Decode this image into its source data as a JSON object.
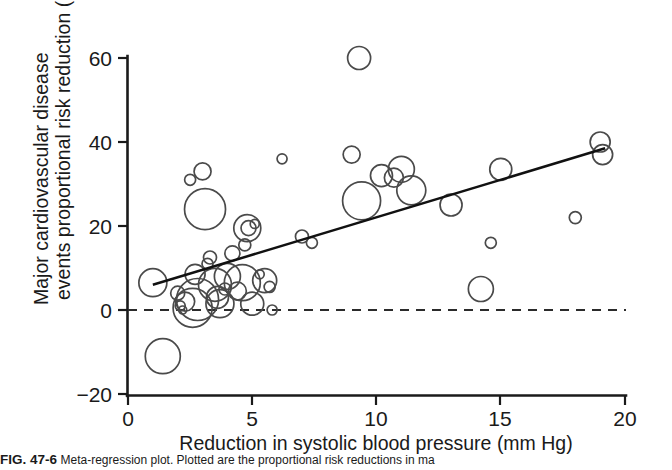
{
  "figure": {
    "caption_label": "FIG. 47-6",
    "caption_body": "Meta-regression plot. Plotted are the proportional risk reductions in ma"
  },
  "chart_data": {
    "type": "scatter",
    "title": "",
    "subtitle": "",
    "xlabel": "Reduction in systolic blood pressure (mm Hg)",
    "ylabel": "Major cardiovascular disease events proportional risk reduction (%)",
    "xlim": [
      0,
      20
    ],
    "ylim": [
      -20,
      60
    ],
    "xticks": [
      0,
      5,
      10,
      15,
      20
    ],
    "xtick_labels": [
      "0",
      "5",
      "10",
      "15",
      "20"
    ],
    "yticks": [
      -20,
      0,
      20,
      40,
      60
    ],
    "ytick_labels": [
      "−20",
      "0",
      "20",
      "40",
      "60"
    ],
    "grid": false,
    "legend": "none",
    "marker_style": "open-circle-bubble",
    "bubble_size_meaning": "trial weight / sample size",
    "series": [
      {
        "name": "Trials",
        "points": [
          {
            "x": 1.0,
            "y": 6.5,
            "r": 14.0
          },
          {
            "x": 1.4,
            "y": -11.0,
            "r": 17.5
          },
          {
            "x": 2.0,
            "y": 4.0,
            "r": 7.0
          },
          {
            "x": 2.1,
            "y": 1.0,
            "r": 5.0
          },
          {
            "x": 2.2,
            "y": 0.0,
            "r": 4.0
          },
          {
            "x": 2.3,
            "y": 2.0,
            "r": 9.5
          },
          {
            "x": 2.5,
            "y": 31.0,
            "r": 5.5
          },
          {
            "x": 2.6,
            "y": 0.5,
            "r": 19.5
          },
          {
            "x": 2.7,
            "y": 8.5,
            "r": 10.0
          },
          {
            "x": 2.8,
            "y": 2.5,
            "r": 21.0
          },
          {
            "x": 3.0,
            "y": 33.0,
            "r": 8.5
          },
          {
            "x": 3.1,
            "y": 24.0,
            "r": 20.5
          },
          {
            "x": 3.2,
            "y": 11.0,
            "r": 5.5
          },
          {
            "x": 3.3,
            "y": 12.5,
            "r": 6.5
          },
          {
            "x": 3.5,
            "y": 6.0,
            "r": 16.5
          },
          {
            "x": 3.6,
            "y": 3.0,
            "r": 11.0
          },
          {
            "x": 3.7,
            "y": 1.5,
            "r": 14.0
          },
          {
            "x": 3.9,
            "y": 5.0,
            "r": 6.0
          },
          {
            "x": 4.0,
            "y": 8.0,
            "r": 13.0
          },
          {
            "x": 4.2,
            "y": 13.5,
            "r": 7.5
          },
          {
            "x": 4.4,
            "y": 4.5,
            "r": 9.0
          },
          {
            "x": 4.6,
            "y": 6.5,
            "r": 18.0
          },
          {
            "x": 4.7,
            "y": 15.5,
            "r": 6.0
          },
          {
            "x": 4.8,
            "y": 19.5,
            "r": 13.5
          },
          {
            "x": 4.85,
            "y": 19.5,
            "r": 7.5
          },
          {
            "x": 5.0,
            "y": 1.5,
            "r": 11.5
          },
          {
            "x": 5.1,
            "y": 20.5,
            "r": 4.5
          },
          {
            "x": 5.3,
            "y": 8.5,
            "r": 4.5
          },
          {
            "x": 5.5,
            "y": 7.0,
            "r": 12.0
          },
          {
            "x": 5.7,
            "y": 5.5,
            "r": 5.5
          },
          {
            "x": 5.8,
            "y": 0.0,
            "r": 5.0
          },
          {
            "x": 6.2,
            "y": 36.0,
            "r": 5.0
          },
          {
            "x": 7.0,
            "y": 17.5,
            "r": 6.5
          },
          {
            "x": 7.4,
            "y": 16.0,
            "r": 5.5
          },
          {
            "x": 9.3,
            "y": 60.0,
            "r": 11.5
          },
          {
            "x": 9.0,
            "y": 37.0,
            "r": 8.5
          },
          {
            "x": 9.4,
            "y": 26.0,
            "r": 19.0
          },
          {
            "x": 10.2,
            "y": 32.0,
            "r": 11.0
          },
          {
            "x": 10.7,
            "y": 31.5,
            "r": 9.5
          },
          {
            "x": 11.0,
            "y": 33.5,
            "r": 13.0
          },
          {
            "x": 11.4,
            "y": 28.5,
            "r": 14.5
          },
          {
            "x": 13.0,
            "y": 25.0,
            "r": 11.0
          },
          {
            "x": 14.2,
            "y": 5.0,
            "r": 12.5
          },
          {
            "x": 14.6,
            "y": 16.0,
            "r": 5.5
          },
          {
            "x": 15.0,
            "y": 33.5,
            "r": 11.0
          },
          {
            "x": 18.0,
            "y": 22.0,
            "r": 6.0
          },
          {
            "x": 19.0,
            "y": 40.0,
            "r": 10.0
          },
          {
            "x": 19.1,
            "y": 37.0,
            "r": 10.0
          }
        ]
      }
    ],
    "regression_line": {
      "label": "meta-regression fit",
      "x_start": 1.0,
      "y_start": 6.0,
      "x_end": 19.2,
      "y_end": 38.5
    },
    "reference_line": {
      "label": "no effect",
      "y": 0,
      "style": "dashed"
    }
  }
}
